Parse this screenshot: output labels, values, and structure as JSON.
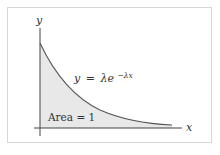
{
  "diagram": {
    "axes": {
      "x_label": "x",
      "y_label": "y"
    },
    "curve_label": {
      "lhs": "y",
      "eq": "=",
      "base": "λe",
      "exponent": "−λx"
    },
    "area_label": "Area = 1",
    "colors": {
      "fill": "#e8e8e8",
      "curve": "#555555",
      "axis": "#444444",
      "frame": "#d6d6d6"
    }
  }
}
